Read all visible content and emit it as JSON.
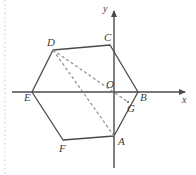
{
  "figure": {
    "kind": "plane-geometry-diagram",
    "background_color": "#ffffff",
    "stroke_color": "#4a4a4a",
    "dashed_color": "#8a8a8a",
    "label_color": "#3d3d3d",
    "width": 196,
    "height": 175
  },
  "axes": {
    "x_axis": {
      "label": "x",
      "label_x": 182,
      "label_y": 103,
      "start_x": 12,
      "start_y": 92,
      "end_x": 188,
      "end_y": 92,
      "arrow": "right"
    },
    "y_axis": {
      "label": "y",
      "label_x": 103,
      "label_y": 12,
      "start_x": 114,
      "start_y": 168,
      "end_x": 114,
      "end_y": 7,
      "arrow": "up"
    },
    "origin": {
      "label": "O",
      "x": 114,
      "y": 92,
      "label_x": 106,
      "label_y": 88
    }
  },
  "hexagon": {
    "name": "ABCDEF",
    "vertices": [
      {
        "label": "A",
        "x": 114,
        "y": 136,
        "label_x": 118,
        "label_y": 145
      },
      {
        "label": "B",
        "x": 138,
        "y": 92,
        "label_x": 140,
        "label_y": 101
      },
      {
        "label": "C",
        "x": 110,
        "y": 45,
        "label_x": 104,
        "label_y": 41
      },
      {
        "label": "D",
        "x": 53,
        "y": 50,
        "label_x": 47,
        "label_y": 46
      },
      {
        "label": "E",
        "x": 32,
        "y": 92,
        "label_x": 24,
        "label_y": 101
      },
      {
        "label": "F",
        "x": 63,
        "y": 140,
        "label_x": 59,
        "label_y": 152
      }
    ]
  },
  "extra_points": [
    {
      "label": "G",
      "x": 128,
      "y": 102,
      "label_x": 127,
      "label_y": 112
    }
  ],
  "dashed_segments": [
    {
      "name": "D-to-G",
      "from": "D",
      "to": "G",
      "x1": 53,
      "y1": 50,
      "x2": 128,
      "y2": 102
    },
    {
      "name": "D-to-A",
      "from": "D",
      "to": "A",
      "x1": 53,
      "y1": 50,
      "x2": 114,
      "y2": 136
    }
  ],
  "page_border": {
    "name": "left-dotted-margin",
    "x": 5,
    "y1": 0,
    "y2": 175,
    "color": "#cfc9c9"
  }
}
